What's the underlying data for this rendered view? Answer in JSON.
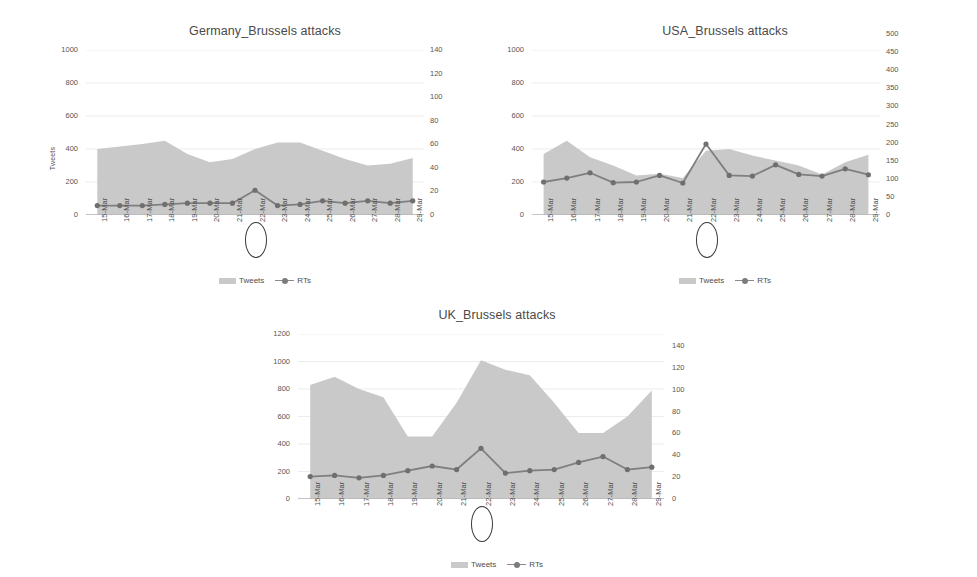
{
  "page": {
    "background": "#ffffff",
    "area_color": "#c9c9c9",
    "line_color": "#7f7f7f",
    "marker_color": "#6f6f6f",
    "text_color": "#4a4a4a"
  },
  "legend": {
    "tweets_label": "Tweets",
    "rts_label": "RTs"
  },
  "annotation": {
    "highlighted_category": "22-Mar"
  },
  "chart_data": [
    {
      "id": "germany",
      "type": "area",
      "title": "Germany_Brussels attacks",
      "xlabel": "",
      "ylabel": "Tweets",
      "ylabel_right": "",
      "categories": [
        "15-Mar",
        "16-Mar",
        "17-Mar",
        "18-Mar",
        "19-Mar",
        "20-Mar",
        "21-Mar",
        "22-Mar",
        "23-Mar",
        "24-Mar",
        "25-Mar",
        "26-Mar",
        "27-Mar",
        "28-Mar",
        "29-Mar"
      ],
      "ylim": [
        0,
        1000
      ],
      "yticks": [
        0,
        200,
        400,
        600,
        800,
        1000
      ],
      "ylim_right": [
        0,
        140
      ],
      "yticks_right": [
        0,
        20,
        40,
        60,
        80,
        100,
        120,
        140
      ],
      "grid": true,
      "legend_position": "bottom",
      "series": [
        {
          "name": "Tweets",
          "axis": "left",
          "render": "area",
          "values": [
            400,
            415,
            430,
            450,
            370,
            320,
            340,
            400,
            440,
            440,
            390,
            340,
            300,
            310,
            345
          ]
        },
        {
          "name": "RTs",
          "axis": "right",
          "render": "line",
          "values": [
            8,
            8,
            8,
            9,
            10,
            10,
            10,
            21,
            8,
            9,
            12,
            10,
            12,
            10,
            12
          ]
        }
      ]
    },
    {
      "id": "usa",
      "type": "area",
      "title": "USA_Brussels attacks",
      "xlabel": "",
      "ylabel": "",
      "ylabel_right": "",
      "categories": [
        "15-Mar",
        "16-Mar",
        "17-Mar",
        "18-Mar",
        "19-Mar",
        "20-Mar",
        "21-Mar",
        "22-Mar",
        "23-Mar",
        "24-Mar",
        "25-Mar",
        "26-Mar",
        "27-Mar",
        "28-Mar",
        "29-Mar"
      ],
      "ylim": [
        0,
        1000
      ],
      "yticks": [
        0,
        200,
        400,
        600,
        800,
        1000
      ],
      "ylim_right": [
        0,
        500
      ],
      "yticks_right": [
        0,
        50,
        100,
        150,
        200,
        250,
        300,
        350,
        400,
        450,
        500
      ],
      "grid": true,
      "legend_position": "bottom",
      "series": [
        {
          "name": "Tweets",
          "axis": "left",
          "render": "area",
          "values": [
            370,
            450,
            350,
            300,
            240,
            250,
            225,
            390,
            400,
            360,
            330,
            300,
            245,
            320,
            365
          ]
        },
        {
          "name": "RTs",
          "axis": "right",
          "render": "line",
          "values": [
            100,
            112,
            128,
            98,
            100,
            120,
            97,
            215,
            120,
            118,
            152,
            123,
            118,
            140,
            122
          ]
        }
      ]
    },
    {
      "id": "uk",
      "type": "area",
      "title": "UK_Brussels attacks",
      "xlabel": "",
      "ylabel": "",
      "ylabel_right": "",
      "categories": [
        "15-Mar",
        "16-Mar",
        "17-Mar",
        "18-Mar",
        "19-Mar",
        "20-Mar",
        "21-Mar",
        "22-Mar",
        "23-Mar",
        "24-Mar",
        "25-Mar",
        "26-Mar",
        "27-Mar",
        "28-Mar",
        "29-Mar"
      ],
      "ylim": [
        0,
        1200
      ],
      "yticks": [
        0,
        200,
        400,
        600,
        800,
        1000,
        1200
      ],
      "ylim_right": [
        0,
        140
      ],
      "yticks_right": [
        0,
        20,
        40,
        60,
        80,
        100,
        120,
        140
      ],
      "grid": true,
      "legend_position": "bottom",
      "series": [
        {
          "name": "Tweets",
          "axis": "left",
          "render": "area",
          "values": [
            830,
            890,
            800,
            740,
            455,
            455,
            700,
            1010,
            940,
            900,
            700,
            480,
            480,
            600,
            790
          ]
        },
        {
          "name": "RTs",
          "axis": "right",
          "render": "line",
          "values": [
            19,
            20,
            18,
            20,
            24,
            28,
            25,
            43,
            22,
            24,
            25,
            31,
            36,
            25,
            27
          ]
        }
      ]
    }
  ]
}
